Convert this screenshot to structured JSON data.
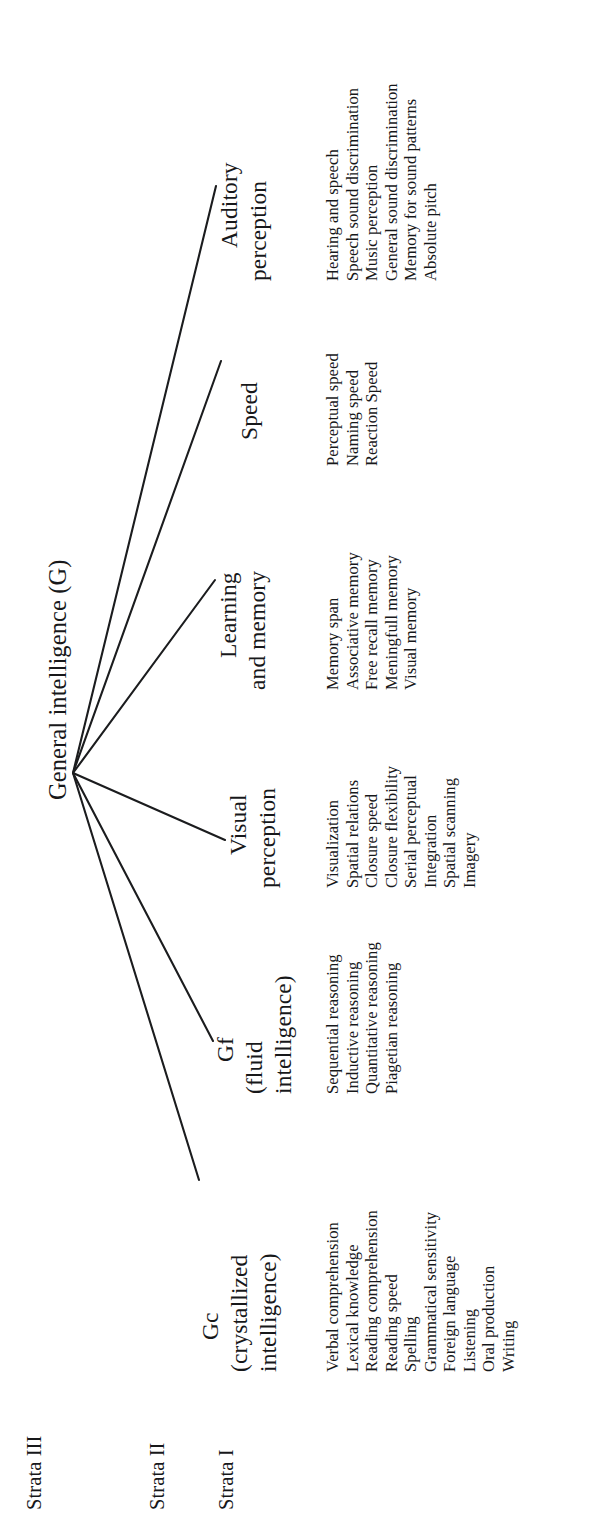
{
  "figure": {
    "root": {
      "label": "General intelligence (G)"
    },
    "strata_captions": [
      {
        "id": "strata-3",
        "label": "Strata III"
      },
      {
        "id": "strata-2",
        "label": "Strata II"
      },
      {
        "id": "strata-1",
        "label": "Strata I"
      }
    ],
    "branches": [
      {
        "id": "gc",
        "name_lines": [
          "Gc",
          "(crystallized",
          "intelligence)"
        ],
        "abilities": [
          "Verbal comprehension",
          "Lexical knowledge",
          "Reading comprehension",
          "Reading speed",
          "Spelling",
          "Grammatical sensitivity",
          "Foreign language",
          "Listening",
          "Oral production",
          "Writing"
        ]
      },
      {
        "id": "gf",
        "name_lines": [
          "Gf",
          "(fluid",
          "intelligence)"
        ],
        "abilities": [
          "Sequential reasoning",
          "Inductive reasoning",
          "Quantitative reasoning",
          "Piagetian reasoning"
        ]
      },
      {
        "id": "visual-perception",
        "name_lines": [
          "Visual",
          "perception"
        ],
        "abilities": [
          "Visualization",
          "Spatial relations",
          "Closure speed",
          "Closure flexibility",
          "Serial perceptual",
          "Integration",
          "Spatial scanning",
          "Imagery"
        ]
      },
      {
        "id": "learning-and-memory",
        "name_lines": [
          "Learning",
          "and memory"
        ],
        "abilities": [
          "Memory span",
          "Associative memory",
          "Free recall memory",
          "Meningfull memory",
          "Visual memory"
        ]
      },
      {
        "id": "speed",
        "name_lines": [
          "Speed"
        ],
        "abilities": [
          "Perceptual speed",
          "Naming speed",
          "Reaction Speed"
        ]
      },
      {
        "id": "auditory-perception",
        "name_lines": [
          "Auditory",
          "perception"
        ],
        "abilities": [
          "Hearing and speech",
          "Speech sound discrimination",
          "Music perception",
          "General sound discrimination",
          "Memory for sound patterns",
          "Absolute pitch"
        ]
      }
    ],
    "colors": {
      "background": "#ffffff",
      "ink": "#17181a",
      "connector": "#1b1c1e"
    }
  }
}
